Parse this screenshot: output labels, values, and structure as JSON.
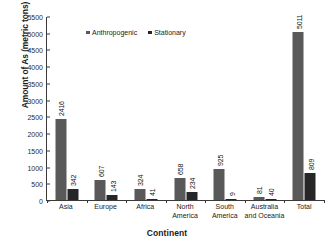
{
  "chart_data": {
    "type": "bar",
    "title": "",
    "xlabel": "Continent",
    "ylabel": "Amount of As (metric tons)",
    "categories": [
      "Asia",
      "Europe",
      "Africa",
      "North America",
      "South America",
      "Australia and Oceania",
      "Total"
    ],
    "category_lines": [
      [
        "Asia"
      ],
      [
        "Europe"
      ],
      [
        "Africa"
      ],
      [
        "North",
        "America"
      ],
      [
        "South",
        "America"
      ],
      [
        "Australia",
        "and Oceania"
      ]
    ],
    "series": [
      {
        "name": "Anthropogenic",
        "color": "#595959",
        "values": [
          2416,
          607,
          324,
          658,
          925,
          81,
          5011
        ]
      },
      {
        "name": "Stationary",
        "color": "#262626",
        "values": [
          342,
          143,
          41,
          234,
          9,
          40,
          809
        ]
      }
    ],
    "ylim": [
      0,
      5500
    ],
    "yticks": [
      0,
      500,
      1000,
      1500,
      2000,
      2500,
      3000,
      3500,
      4000,
      4500,
      5000,
      5500
    ],
    "ytick_labels": [
      "0",
      "500",
      "1000",
      "1500",
      "2000",
      "2500",
      "3000",
      "3500",
      "4000",
      "4500",
      "5000",
      "5500"
    ],
    "grid": false,
    "legend_position": "top-center",
    "value_labels_rotated": true
  },
  "axes": {
    "y_title": "Amount of As (metric tons)",
    "x_title": "Continent"
  },
  "legend": {
    "items": [
      {
        "label": "Anthropogenic",
        "color": "#595959"
      },
      {
        "label": "Stationary",
        "color": "#262626"
      }
    ]
  }
}
